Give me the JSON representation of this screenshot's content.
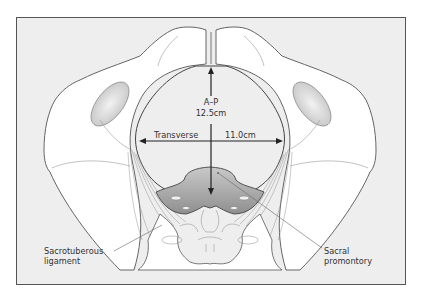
{
  "figure": {
    "measurements": {
      "ap": {
        "label": "A–P",
        "value": "12.5cm"
      },
      "transverse": {
        "label": "Transverse",
        "value": "11.0cm"
      }
    },
    "annotations": {
      "sacrotuberous": {
        "line1": "Sacrotuberous",
        "line2": "ligament"
      },
      "sacral": {
        "line1": "Sacral",
        "line2": "promontory"
      }
    },
    "colors": {
      "background": "#eeeeee",
      "bone": "#ffffff",
      "outline": "#555555",
      "sacrum_shade": "#a9a9a9",
      "arrow": "#222222"
    }
  }
}
